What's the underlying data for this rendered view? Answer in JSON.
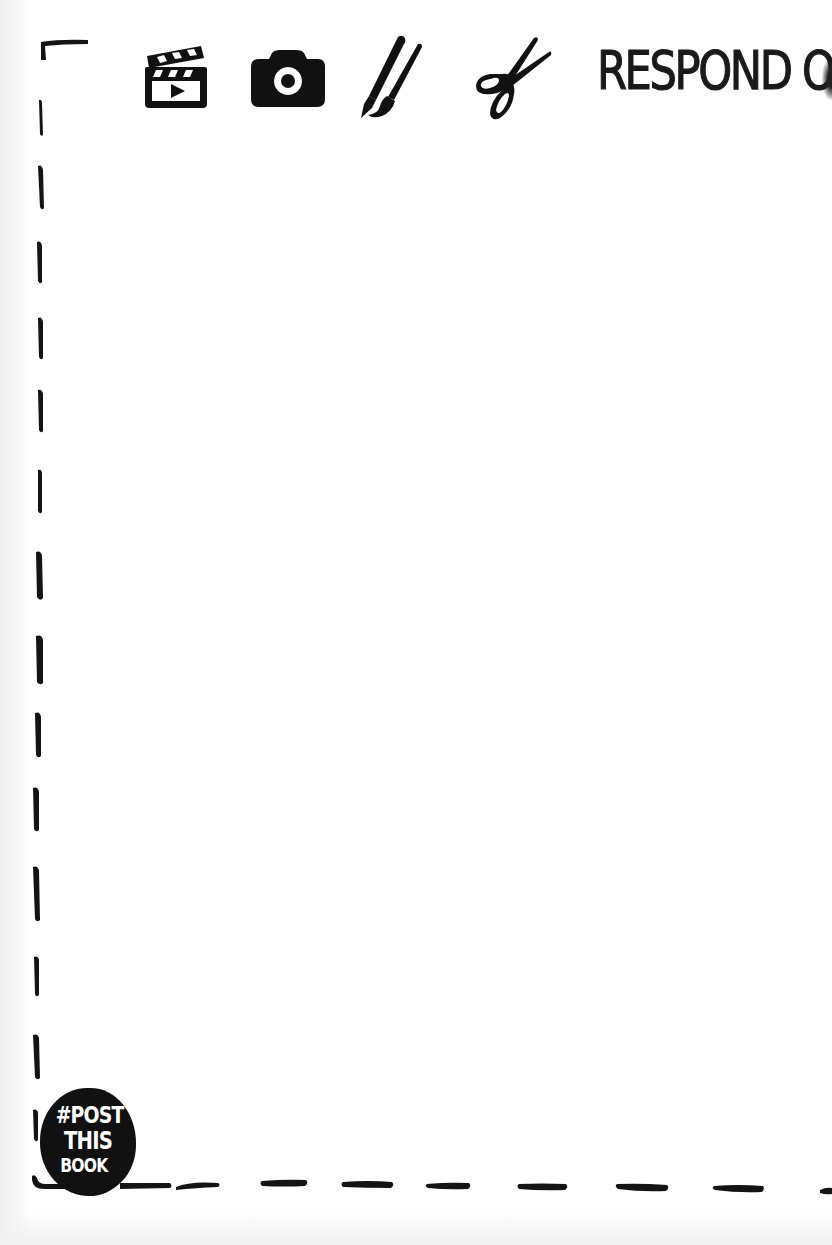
{
  "page": {
    "title": "RESPOND ON",
    "background_color": "#fefefe",
    "ink_color": "#111111"
  },
  "toolbar": {
    "icons": [
      {
        "name": "clapperboard-video-icon",
        "label": "video"
      },
      {
        "name": "camera-icon",
        "label": "photo"
      },
      {
        "name": "pen-and-brush-icon",
        "label": "draw / paint"
      },
      {
        "name": "scissors-icon",
        "label": "cut / collage"
      }
    ]
  },
  "badge": {
    "line1": "#POST",
    "line2": "THIS",
    "line3": "BOOK"
  },
  "frame": {
    "style": "hand-drawn dashed border",
    "left_dash_count": 14,
    "bottom_dash_count": 8
  }
}
